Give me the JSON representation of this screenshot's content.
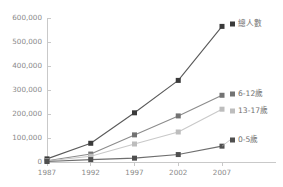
{
  "chart_data": {
    "type": "line",
    "title": "",
    "xlabel": "",
    "ylabel": "",
    "categories": [
      "1987",
      "1992",
      "1997",
      "2002",
      "2007"
    ],
    "ylim": [
      0,
      600000
    ],
    "yticks": [
      0,
      100000,
      200000,
      300000,
      400000,
      500000,
      600000
    ],
    "ytick_labels": [
      "0",
      "100,000",
      "200,000",
      "300,000",
      "400,000",
      "500,000",
      "600,000"
    ],
    "grid": false,
    "legend_position": "right-inline-end-of-line",
    "marker": "square",
    "series": [
      {
        "name": "總人數",
        "color": "#3a3a3a",
        "line_color": "#5a5a5a",
        "values": [
          13000,
          78000,
          205000,
          340000,
          565000
        ]
      },
      {
        "name": "6-12歲",
        "color": "#737373",
        "line_color": "#8c8c8c",
        "values": [
          5000,
          33000,
          113000,
          192000,
          278000
        ]
      },
      {
        "name": "13-17歲",
        "color": "#bdbdbd",
        "line_color": "#c9c9c9",
        "values": [
          4000,
          24000,
          75000,
          125000,
          220000
        ]
      },
      {
        "name": "0-5歲",
        "color": "#4f4f4f",
        "line_color": "#6e6e6e",
        "values": [
          2000,
          10000,
          16000,
          31000,
          66000
        ]
      }
    ]
  },
  "axes": {
    "axis_color": "#c9c9c9",
    "tick_color": "#8a8a8a"
  }
}
